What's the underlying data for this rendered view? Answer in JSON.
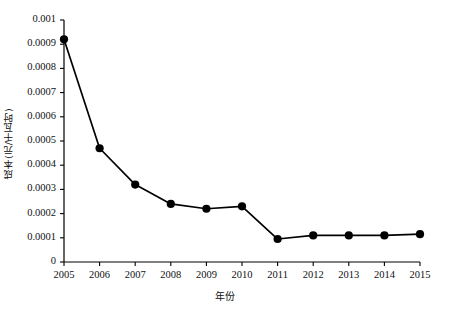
{
  "chart_data": {
    "type": "line",
    "title": "",
    "xlabel": "年份",
    "ylabel": "成本(元/千瓦时)",
    "categories": [
      "2005",
      "2006",
      "2007",
      "2008",
      "2009",
      "2010",
      "2011",
      "2012",
      "2013",
      "2014",
      "2015"
    ],
    "x": [
      2005,
      2006,
      2007,
      2008,
      2009,
      2010,
      2011,
      2012,
      2013,
      2014,
      2015
    ],
    "values": [
      0.00092,
      0.00047,
      0.00032,
      0.00024,
      0.00022,
      0.00023,
      9.5e-05,
      0.00011,
      0.00011,
      0.00011,
      0.000115
    ],
    "ylim": [
      0,
      0.001
    ],
    "xlim": [
      2005,
      2015
    ],
    "ytick_labels": [
      "0.001",
      "0.0009",
      "0.0008",
      "0.0007",
      "0.0006",
      "0.0005",
      "0.0004",
      "0.0003",
      "0.0002",
      "0.0001",
      "0"
    ],
    "ytick_values": [
      0.001,
      0.0009,
      0.0008,
      0.0007,
      0.0006,
      0.0005,
      0.0004,
      0.0003,
      0.0002,
      0.0001,
      0
    ],
    "grid": false,
    "legend": false,
    "legend_position": "none",
    "marker": "filled-circle",
    "series_color": "#000000",
    "axis_color": "#000000",
    "background_color": "#ffffff"
  },
  "caption": {
    "text": ""
  }
}
